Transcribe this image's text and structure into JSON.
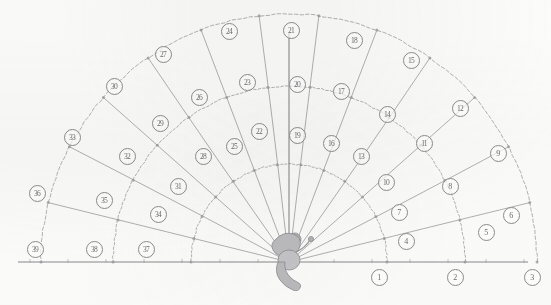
{
  "diagram": {
    "type": "polar-sector-grid",
    "origin": {
      "x": 289,
      "y": 262,
      "label": "thrower-origin"
    },
    "figure": {
      "name": "thrower-figure",
      "description": "stylised human figure at sector apex"
    },
    "geometry": {
      "sector_count": 13,
      "band_count": 3,
      "angle_start_deg": 0,
      "angle_end_deg": 180,
      "radii": [
        98,
        176,
        248
      ],
      "axis_line": {
        "y": 262,
        "x_left": 18,
        "x_right": 528
      },
      "vertical_axis": {
        "x": 289,
        "y_top": 33,
        "y_bottom": 262
      }
    },
    "colors": {
      "ink": "#8d8d90",
      "ink_light": "#a9a9ad",
      "label_text": "#6e6e72",
      "paper": "#fdfdfc",
      "figure_fill": "#b9b9bb"
    },
    "zones": [
      {
        "n": "1",
        "x": 379,
        "y": 277,
        "band": 1,
        "sector": 1
      },
      {
        "n": "2",
        "x": 455,
        "y": 277,
        "band": 2,
        "sector": 1
      },
      {
        "n": "3",
        "x": 532,
        "y": 277,
        "band": 3,
        "sector": 1
      },
      {
        "n": "4",
        "x": 406,
        "y": 241,
        "band": 1,
        "sector": 2
      },
      {
        "n": "5",
        "x": 486,
        "y": 232,
        "band": 2,
        "sector": 2
      },
      {
        "n": "6",
        "x": 511,
        "y": 215,
        "band": 3,
        "sector": 2
      },
      {
        "n": "7",
        "x": 399,
        "y": 212,
        "band": 1,
        "sector": 3
      },
      {
        "n": "8",
        "x": 450,
        "y": 186,
        "band": 2,
        "sector": 3
      },
      {
        "n": "9",
        "x": 498,
        "y": 153,
        "band": 3,
        "sector": 3
      },
      {
        "n": "10",
        "x": 386,
        "y": 182,
        "band": 1,
        "sector": 4
      },
      {
        "n": "11",
        "x": 424,
        "y": 143,
        "band": 2,
        "sector": 4
      },
      {
        "n": "12",
        "x": 460,
        "y": 108,
        "band": 3,
        "sector": 4
      },
      {
        "n": "13",
        "x": 361,
        "y": 156,
        "band": 1,
        "sector": 5
      },
      {
        "n": "14",
        "x": 387,
        "y": 114,
        "band": 2,
        "sector": 5
      },
      {
        "n": "15",
        "x": 411,
        "y": 60,
        "band": 3,
        "sector": 5
      },
      {
        "n": "16",
        "x": 331,
        "y": 143,
        "band": 1,
        "sector": 6
      },
      {
        "n": "17",
        "x": 341,
        "y": 91,
        "band": 2,
        "sector": 6
      },
      {
        "n": "18",
        "x": 354,
        "y": 40,
        "band": 3,
        "sector": 6
      },
      {
        "n": "19",
        "x": 297,
        "y": 135,
        "band": 1,
        "sector": 7
      },
      {
        "n": "20",
        "x": 297,
        "y": 84,
        "band": 2,
        "sector": 7
      },
      {
        "n": "21",
        "x": 291,
        "y": 30,
        "band": 3,
        "sector": 7
      },
      {
        "n": "22",
        "x": 259,
        "y": 131,
        "band": 1,
        "sector": 8
      },
      {
        "n": "23",
        "x": 247,
        "y": 82,
        "band": 2,
        "sector": 8
      },
      {
        "n": "24",
        "x": 229,
        "y": 31,
        "band": 3,
        "sector": 8
      },
      {
        "n": "25",
        "x": 234,
        "y": 146,
        "band": 1,
        "sector": 9
      },
      {
        "n": "26",
        "x": 199,
        "y": 97,
        "band": 2,
        "sector": 9
      },
      {
        "n": "27",
        "x": 163,
        "y": 54,
        "band": 3,
        "sector": 9
      },
      {
        "n": "28",
        "x": 203,
        "y": 156,
        "band": 1,
        "sector": 10
      },
      {
        "n": "29",
        "x": 160,
        "y": 123,
        "band": 2,
        "sector": 10
      },
      {
        "n": "30",
        "x": 114,
        "y": 86,
        "band": 3,
        "sector": 10
      },
      {
        "n": "31",
        "x": 178,
        "y": 186,
        "band": 1,
        "sector": 11
      },
      {
        "n": "32",
        "x": 127,
        "y": 156,
        "band": 2,
        "sector": 11
      },
      {
        "n": "33",
        "x": 72,
        "y": 137,
        "band": 3,
        "sector": 11
      },
      {
        "n": "34",
        "x": 158,
        "y": 214,
        "band": 1,
        "sector": 12
      },
      {
        "n": "35",
        "x": 104,
        "y": 200,
        "band": 2,
        "sector": 12
      },
      {
        "n": "36",
        "x": 37,
        "y": 193,
        "band": 3,
        "sector": 12
      },
      {
        "n": "37",
        "x": 146,
        "y": 249,
        "band": 1,
        "sector": 13
      },
      {
        "n": "38",
        "x": 94,
        "y": 249,
        "band": 2,
        "sector": 13
      },
      {
        "n": "39",
        "x": 35,
        "y": 249,
        "band": 3,
        "sector": 13
      }
    ]
  }
}
